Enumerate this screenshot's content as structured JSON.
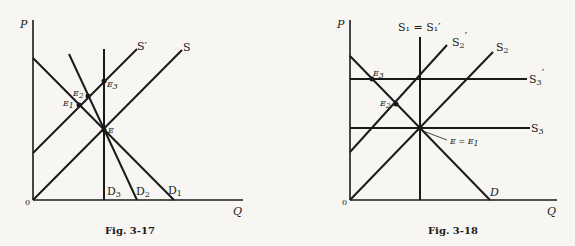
{
  "figures": [
    {
      "caption": "Fig. 3-17",
      "axes": {
        "y_label": "P",
        "x_label": "Q",
        "origin_label": "0"
      },
      "curves": {
        "S": "S",
        "S_prime": "S′",
        "D1": "D",
        "D1_sub": "1",
        "D2": "D",
        "D2_sub": "2",
        "D3": "D",
        "D3_sub": "3"
      },
      "points": {
        "E": "E",
        "E1": "E",
        "E1_sub": "1",
        "E2": "E",
        "E2_sub": "2",
        "E3": "E",
        "E3_sub": "3"
      }
    },
    {
      "caption": "Fig. 3-18",
      "axes": {
        "y_label": "P",
        "x_label": "Q",
        "origin_label": "0"
      },
      "curves": {
        "S1_eq": "S₁ = S₁′",
        "S2": "S",
        "S2_sub": "2",
        "S2_prime": "S",
        "S2_prime_sub": "2",
        "S3": "S",
        "S3_sub": "3",
        "S3_prime": "S",
        "S3_prime_sub": "3",
        "prime": "′",
        "D": "D"
      },
      "points": {
        "E_eq": "E = E",
        "E_eq_sub": "1",
        "E2": "E",
        "E2_sub": "2",
        "E3": "E",
        "E3_sub": "3"
      }
    }
  ]
}
